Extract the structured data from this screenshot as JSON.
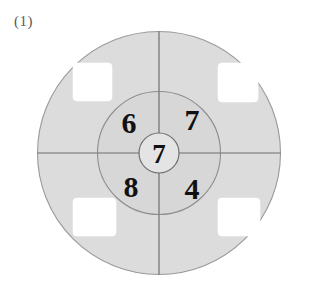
{
  "figure": {
    "label": "(1)",
    "type": "concentric-circle-number-diagram",
    "background_color": "#ffffff"
  },
  "geometry": {
    "center_x": 159,
    "center_y": 153,
    "outer_radius": 122,
    "middle_radius": 62,
    "inner_radius": 20
  },
  "colors": {
    "outer_fill": "#dcdcdc",
    "middle_fill": "#d7d7d7",
    "inner_fill": "#e4e4e4",
    "stroke": "#8e8e8e",
    "cross_line": "#6e6e6e",
    "cutout_fill": "#ffffff",
    "number_color": "#111111",
    "label_color": "#5a5a5a"
  },
  "numbers": {
    "center": "7",
    "quadrants": [
      {
        "position": "top-left",
        "value": "6",
        "x": 129,
        "y": 122
      },
      {
        "position": "top-right",
        "value": "7",
        "x": 192,
        "y": 119
      },
      {
        "position": "bottom-left",
        "value": "8",
        "x": 131,
        "y": 186
      },
      {
        "position": "bottom-right",
        "value": "4",
        "x": 192,
        "y": 188
      }
    ]
  },
  "cutout_squares": [
    {
      "position": "top-left",
      "x": 73,
      "y": 63,
      "width": 39,
      "height": 38,
      "radius": 4
    },
    {
      "position": "top-right",
      "x": 218,
      "y": 63,
      "width": 40,
      "height": 39,
      "radius": 4
    },
    {
      "position": "bottom-left",
      "x": 73,
      "y": 198,
      "width": 43,
      "height": 38,
      "radius": 4
    },
    {
      "position": "bottom-right",
      "x": 218,
      "y": 198,
      "width": 42,
      "height": 38,
      "radius": 4
    }
  ],
  "cross_lines": [
    {
      "orientation": "vertical",
      "x1": 159,
      "y1": 31,
      "x2": 159,
      "y2": 275
    },
    {
      "orientation": "horizontal",
      "x1": 37,
      "y1": 153,
      "x2": 281,
      "y2": 153
    }
  ]
}
